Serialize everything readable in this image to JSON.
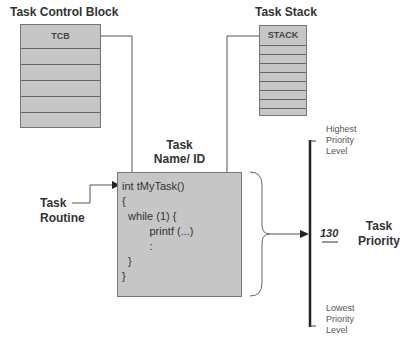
{
  "tcb": {
    "title": "Task Control Block",
    "header": "TCB",
    "rows": 5
  },
  "stack": {
    "title": "Task Stack",
    "header": "STACK",
    "rows": 8
  },
  "task_name": {
    "line1": "Task",
    "line2": "Name/ ID"
  },
  "task_routine": {
    "line1": "Task",
    "line2": "Routine"
  },
  "code": {
    "lines": [
      "int tMyTask()",
      "{",
      "  while (1) {",
      "         printf (...)",
      "         :",
      "  }",
      "}"
    ]
  },
  "priority": {
    "value": "130",
    "label_line1": "Task",
    "label_line2": "Priority",
    "highest": [
      "Highest",
      "Priority",
      "Level"
    ],
    "lowest": [
      "Lowest",
      "Priority",
      "Level"
    ]
  },
  "colors": {
    "box_fill": "#c6c6c6",
    "line": "#555555"
  }
}
